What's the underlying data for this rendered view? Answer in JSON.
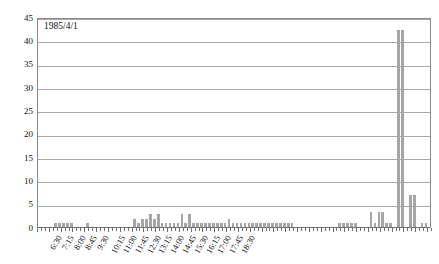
{
  "chart_data": {
    "type": "bar",
    "title": "1985/4/1",
    "xlabel": "",
    "ylabel": "",
    "ylim": [
      0,
      45
    ],
    "ytick_step": 5,
    "ytick_labels": [
      "0",
      "5",
      "10",
      "15",
      "20",
      "25",
      "30",
      "35",
      "40",
      "45"
    ],
    "grid": true,
    "legend": "none",
    "bar_color": "#a6a6a6",
    "bin_minutes": 15,
    "x_start": "6:30",
    "x_tick_labels": [
      "6:30",
      "7:15",
      "8:00",
      "8:45",
      "9:30",
      "10:15",
      "11:00",
      "11:45",
      "12:30",
      "13:15",
      "14:00",
      "14:45",
      "15:30",
      "16:15",
      "17:00",
      "17:45",
      "18:30"
    ],
    "x_tick_interval_bins": 3,
    "categories": [
      "6:30",
      "6:45",
      "7:00",
      "7:15",
      "7:30",
      "7:45",
      "8:00",
      "8:15",
      "8:30",
      "8:45",
      "9:00",
      "9:15",
      "9:30",
      "9:45",
      "10:00",
      "10:15",
      "10:30",
      "10:45",
      "11:00",
      "11:15",
      "11:30",
      "11:45",
      "12:00",
      "12:15",
      "12:30",
      "12:45",
      "13:00",
      "13:15",
      "13:30",
      "13:45",
      "14:00",
      "14:15",
      "14:30",
      "14:45",
      "15:00",
      "15:15",
      "15:30",
      "15:45",
      "16:00",
      "16:15",
      "16:30",
      "16:45",
      "17:00",
      "17:15",
      "17:30",
      "17:45",
      "18:00",
      "18:15",
      "18:30",
      "18:45",
      "19:00"
    ],
    "values": [
      0,
      0,
      1,
      1,
      1,
      1,
      0,
      1,
      0,
      0,
      0,
      0,
      2,
      1,
      2,
      3,
      2,
      1,
      1,
      1,
      3,
      1,
      3,
      1,
      1,
      1,
      1,
      1,
      1,
      1,
      2,
      1,
      1,
      1,
      1,
      1,
      1,
      1,
      1,
      1,
      1,
      0,
      0,
      0,
      0,
      0,
      1,
      1,
      1,
      0,
      0
    ],
    "values_full": [
      0,
      0,
      1,
      1,
      1,
      1,
      0,
      1,
      0,
      0,
      0,
      0,
      2,
      1,
      2,
      3,
      2,
      1,
      1,
      1,
      3,
      1,
      3,
      1,
      1,
      1,
      1,
      1,
      1,
      1,
      2,
      1,
      1,
      1,
      1,
      1,
      1,
      1,
      1,
      1,
      1,
      0,
      0,
      0,
      0,
      0,
      1,
      1,
      1,
      0,
      0,
      0,
      0,
      0,
      0,
      0,
      0,
      0,
      0,
      0,
      0,
      0,
      0,
      0,
      0,
      0,
      0,
      0,
      0,
      0,
      0,
      0
    ],
    "peak_values": [
      42.5,
      42.5
    ],
    "peak_labels": [
      "17:50",
      "18:00"
    ],
    "max_value": 42.5
  },
  "bars": [
    {
      "t": "6:30",
      "v": 0
    },
    {
      "t": "6:37",
      "v": 0
    },
    {
      "t": "6:45",
      "v": 0
    },
    {
      "t": "6:52",
      "v": 0
    },
    {
      "t": "7:00",
      "v": 1
    },
    {
      "t": "7:07",
      "v": 1
    },
    {
      "t": "7:15",
      "v": 1
    },
    {
      "t": "7:22",
      "v": 1
    },
    {
      "t": "7:30",
      "v": 1
    },
    {
      "t": "7:37",
      "v": 0
    },
    {
      "t": "7:45",
      "v": 0
    },
    {
      "t": "7:52",
      "v": 0
    },
    {
      "t": "8:00",
      "v": 1
    },
    {
      "t": "8:07",
      "v": 0
    },
    {
      "t": "8:15",
      "v": 0
    },
    {
      "t": "8:22",
      "v": 0
    },
    {
      "t": "8:30",
      "v": 0
    },
    {
      "t": "8:37",
      "v": 0
    },
    {
      "t": "8:45",
      "v": 0
    },
    {
      "t": "8:52",
      "v": 0
    },
    {
      "t": "9:00",
      "v": 0
    },
    {
      "t": "9:07",
      "v": 0
    },
    {
      "t": "9:15",
      "v": 0
    },
    {
      "t": "9:22",
      "v": 0
    },
    {
      "t": "9:30",
      "v": 2
    },
    {
      "t": "9:37",
      "v": 1
    },
    {
      "t": "9:45",
      "v": 2
    },
    {
      "t": "9:52",
      "v": 2
    },
    {
      "t": "10:00",
      "v": 3
    },
    {
      "t": "10:07",
      "v": 2
    },
    {
      "t": "10:15",
      "v": 3
    },
    {
      "t": "10:22",
      "v": 1
    },
    {
      "t": "10:30",
      "v": 1
    },
    {
      "t": "10:37",
      "v": 1
    },
    {
      "t": "10:45",
      "v": 1
    },
    {
      "t": "10:52",
      "v": 1
    },
    {
      "t": "11:00",
      "v": 3
    },
    {
      "t": "11:07",
      "v": 1
    },
    {
      "t": "11:15",
      "v": 3
    },
    {
      "t": "11:22",
      "v": 1
    },
    {
      "t": "11:30",
      "v": 1
    },
    {
      "t": "11:37",
      "v": 1
    },
    {
      "t": "11:45",
      "v": 1
    },
    {
      "t": "11:52",
      "v": 1
    },
    {
      "t": "12:00",
      "v": 1
    },
    {
      "t": "12:07",
      "v": 1
    },
    {
      "t": "12:15",
      "v": 1
    },
    {
      "t": "12:22",
      "v": 1
    },
    {
      "t": "12:30",
      "v": 2
    },
    {
      "t": "12:37",
      "v": 1
    },
    {
      "t": "12:45",
      "v": 1
    },
    {
      "t": "12:52",
      "v": 1
    },
    {
      "t": "13:00",
      "v": 1
    },
    {
      "t": "13:07",
      "v": 1
    },
    {
      "t": "13:15",
      "v": 1
    },
    {
      "t": "13:22",
      "v": 1
    },
    {
      "t": "13:30",
      "v": 1
    },
    {
      "t": "13:37",
      "v": 1
    },
    {
      "t": "13:45",
      "v": 1
    },
    {
      "t": "13:52",
      "v": 1
    },
    {
      "t": "14:00",
      "v": 1
    },
    {
      "t": "14:07",
      "v": 1
    },
    {
      "t": "14:15",
      "v": 1
    },
    {
      "t": "14:22",
      "v": 1
    },
    {
      "t": "14:30",
      "v": 1
    },
    {
      "t": "14:37",
      "v": 0
    },
    {
      "t": "14:45",
      "v": 0
    },
    {
      "t": "14:52",
      "v": 0
    },
    {
      "t": "15:00",
      "v": 0
    },
    {
      "t": "15:07",
      "v": 0
    },
    {
      "t": "15:15",
      "v": 0
    },
    {
      "t": "15:22",
      "v": 0
    },
    {
      "t": "15:30",
      "v": 0
    },
    {
      "t": "15:37",
      "v": 0
    },
    {
      "t": "15:45",
      "v": 0
    },
    {
      "t": "15:52",
      "v": 0
    },
    {
      "t": "16:00",
      "v": 1
    },
    {
      "t": "16:07",
      "v": 1
    },
    {
      "t": "16:15",
      "v": 1
    },
    {
      "t": "16:22",
      "v": 1
    },
    {
      "t": "16:30",
      "v": 1
    },
    {
      "t": "16:37",
      "v": 0
    },
    {
      "t": "16:45",
      "v": 0
    },
    {
      "t": "16:52",
      "v": 0
    },
    {
      "t": "17:00",
      "v": 3.5
    },
    {
      "t": "17:07",
      "v": 1
    },
    {
      "t": "17:15",
      "v": 3.5
    },
    {
      "t": "17:22",
      "v": 3.5
    },
    {
      "t": "17:30",
      "v": 1
    },
    {
      "t": "17:37",
      "v": 1
    },
    {
      "t": "17:45",
      "v": 0
    },
    {
      "t": "17:52",
      "v": 42.5
    },
    {
      "t": "18:00",
      "v": 42.5
    },
    {
      "t": "18:07",
      "v": 0
    },
    {
      "t": "18:15",
      "v": 7
    },
    {
      "t": "18:22",
      "v": 7
    },
    {
      "t": "18:30",
      "v": 0
    },
    {
      "t": "18:37",
      "v": 1
    },
    {
      "t": "18:45",
      "v": 1
    },
    {
      "t": "18:52",
      "v": 0
    }
  ]
}
